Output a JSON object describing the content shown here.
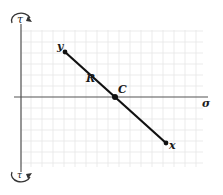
{
  "diagram": {
    "type": "mohr-circle-plot",
    "axes": {
      "horizontal_label": "σ",
      "vertical_label_top": "τ",
      "vertical_label_bottom": "τ"
    },
    "points": [
      {
        "id": "y",
        "label": "y"
      },
      {
        "id": "C",
        "label": "C"
      },
      {
        "id": "x",
        "label": "x"
      }
    ],
    "segment_label": "R",
    "icons": {
      "top": "clockwise-arrow-icon",
      "bottom": "counterclockwise-arrow-icon"
    },
    "colors": {
      "line": "#111111",
      "axis": "#555555",
      "grid": "#e4e4e4"
    }
  }
}
